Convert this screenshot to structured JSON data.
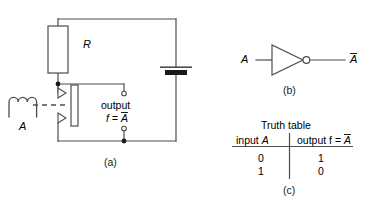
{
  "figure": {
    "type": "electrical-logic-diagram",
    "stroke_color": "#4d4d4d",
    "fill_color": "#1a1a1a",
    "text_color": "#1a1a1a"
  },
  "panel_a": {
    "caption": "(a)",
    "resistor_label": "R",
    "coil_label": "A",
    "output_label": "output",
    "output_expr_prefix": "f = ",
    "output_expr_var": "A",
    "components": {
      "resistor": "resistor-R",
      "battery": "battery-cell",
      "relay_coil": "relay-coil-A",
      "reed_switch": "reed-switch-armature",
      "contact_upper": "relay-contact-upper",
      "contact_lower": "relay-contact-lower",
      "terminal_upper": "output-terminal-upper",
      "terminal_lower": "output-terminal-lower",
      "junction_upper": "wire-junction-upper",
      "junction_lower": "wire-junction-lower"
    }
  },
  "panel_b": {
    "caption": "(b)",
    "input_label": "A",
    "output_label": "A",
    "gate": "inverter-not-gate",
    "bubble": "inversion-bubble"
  },
  "panel_c": {
    "caption": "(c)",
    "title": "Truth table",
    "columns": [
      {
        "prefix": "input ",
        "var": "A",
        "overbar": false
      },
      {
        "prefix": "output f = ",
        "var": "A",
        "overbar": true
      }
    ],
    "rows": [
      {
        "input": "0",
        "output": "1"
      },
      {
        "input": "1",
        "output": "0"
      }
    ]
  }
}
